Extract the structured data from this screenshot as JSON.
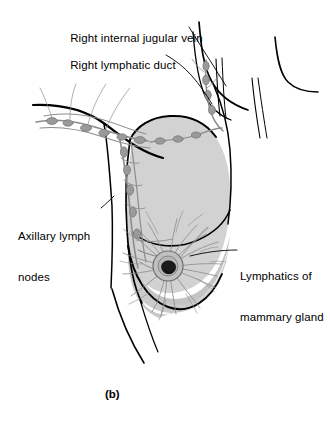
{
  "figure": {
    "caption": "(b)",
    "background_color": "#ffffff",
    "ink_color": "#000000",
    "breast_fill_color": "#d2d2d2",
    "breast_fill_lower_color": "#c4c4c4",
    "lymphatic_color": "#8c8c8c",
    "labels": [
      {
        "id": "jugular",
        "lines": [
          "Right internal jugular vein"
        ],
        "name": "label-right-internal-jugular-vein"
      },
      {
        "id": "duct",
        "lines": [
          "Right lymphatic duct"
        ],
        "name": "label-right-lymphatic-duct"
      },
      {
        "id": "axillary",
        "lines": [
          "Axillary lymph",
          "nodes"
        ],
        "name": "label-axillary-lymph-nodes"
      },
      {
        "id": "mammary",
        "lines": [
          "Lymphatics of",
          "mammary gland"
        ],
        "name": "label-lymphatics-of-mammary-gland"
      }
    ],
    "label_text": {
      "jugular": "Right internal jugular vein",
      "duct": "Right lymphatic duct",
      "axillary_line1": "Axillary lymph",
      "axillary_line2": "nodes",
      "mammary_line1": "Lymphatics of",
      "mammary_line2": "mammary gland"
    }
  }
}
